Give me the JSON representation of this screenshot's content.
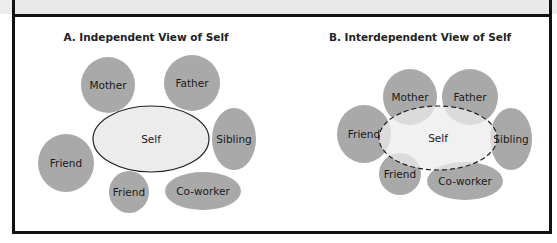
{
  "figure": {
    "panel_a": {
      "title": "A. Independent View of Self",
      "self_label": "Self",
      "others": [
        {
          "label": "Mother",
          "cx": 108,
          "cy": 85,
          "rx": 27,
          "ry": 28
        },
        {
          "label": "Father",
          "cx": 192,
          "cy": 83,
          "rx": 28,
          "ry": 28
        },
        {
          "label": "Sibling",
          "cx": 234,
          "cy": 139,
          "rx": 22,
          "ry": 31
        },
        {
          "label": "Friend",
          "cx": 66,
          "cy": 163,
          "rx": 28,
          "ry": 29
        },
        {
          "label": "Friend",
          "cx": 129,
          "cy": 192,
          "rx": 20,
          "ry": 21
        },
        {
          "label": "Co-worker",
          "cx": 203,
          "cy": 191,
          "rx": 38,
          "ry": 19
        }
      ]
    },
    "panel_b": {
      "title": "B. Interdependent View of Self",
      "self_label": "Self",
      "others": [
        {
          "label": "Mother",
          "cx": 410,
          "cy": 97,
          "rx": 27,
          "ry": 28
        },
        {
          "label": "Father",
          "cx": 470,
          "cy": 97,
          "rx": 28,
          "ry": 28
        },
        {
          "label": "Friend",
          "cx": 364,
          "cy": 134,
          "rx": 27,
          "ry": 29
        },
        {
          "label": "Sibling",
          "cx": 511,
          "cy": 139,
          "rx": 21,
          "ry": 31
        },
        {
          "label": "Friend",
          "cx": 400,
          "cy": 174,
          "rx": 21,
          "ry": 21
        },
        {
          "label": "Co-worker",
          "cx": 465,
          "cy": 181,
          "rx": 38,
          "ry": 19
        }
      ]
    },
    "colors": {
      "other_fill": "#a9a9a9",
      "self_fill": "#ececec",
      "self_stroke": "#222222",
      "frame": "#111111",
      "top_band": "#e9e9e9"
    }
  }
}
